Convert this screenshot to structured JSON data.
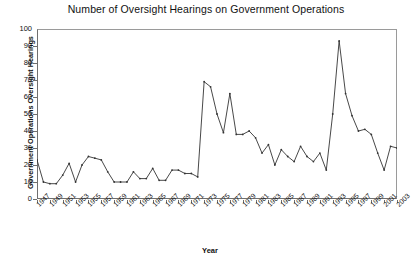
{
  "chart_data": {
    "type": "line",
    "title": "Number of Oversight Hearings on Government Operations",
    "xlabel": "Year",
    "ylabel": "Government Operations Oversight Hearings",
    "ylim": [
      0,
      100
    ],
    "ytick_step": 10,
    "yticks": [
      0,
      10,
      20,
      30,
      40,
      50,
      60,
      70,
      80,
      90,
      100
    ],
    "xlim": [
      1947,
      2003
    ],
    "xticks": [
      1947,
      1949,
      1951,
      1953,
      1955,
      1957,
      1959,
      1961,
      1963,
      1965,
      1967,
      1969,
      1971,
      1973,
      1975,
      1977,
      1979,
      1981,
      1983,
      1985,
      1987,
      1989,
      1991,
      1993,
      1995,
      1997,
      1999,
      2001,
      2003
    ],
    "grid": false,
    "legend": false,
    "marker": "dot",
    "line_color": "#333333",
    "x": [
      1947,
      1948,
      1949,
      1950,
      1951,
      1952,
      1953,
      1954,
      1955,
      1956,
      1957,
      1958,
      1959,
      1960,
      1961,
      1962,
      1963,
      1964,
      1965,
      1966,
      1967,
      1968,
      1969,
      1970,
      1971,
      1972,
      1973,
      1974,
      1975,
      1976,
      1977,
      1978,
      1979,
      1980,
      1981,
      1982,
      1983,
      1984,
      1985,
      1986,
      1987,
      1988,
      1989,
      1990,
      1991,
      1992,
      1993,
      1994,
      1995,
      1996,
      1997,
      1998,
      1999,
      2000,
      2001,
      2002,
      2003
    ],
    "values": [
      23,
      10,
      9,
      9,
      14,
      21,
      10,
      20,
      25,
      24,
      23,
      16,
      10,
      10,
      10,
      16,
      12,
      12,
      18,
      11,
      11,
      17,
      17,
      15,
      15,
      13,
      69,
      66,
      50,
      39,
      62,
      38,
      38,
      40,
      36,
      27,
      32,
      20,
      29,
      25,
      22,
      31,
      25,
      22,
      27,
      17,
      50,
      93,
      62,
      49,
      40,
      41,
      38,
      27,
      17,
      31,
      30
    ],
    "annotations": [
      {
        "label": "peak",
        "x": 1973,
        "y": 69
      },
      {
        "label": "peak",
        "x": 1977,
        "y": 62
      },
      {
        "label": "peak",
        "x": 1994,
        "y": 93
      }
    ]
  }
}
